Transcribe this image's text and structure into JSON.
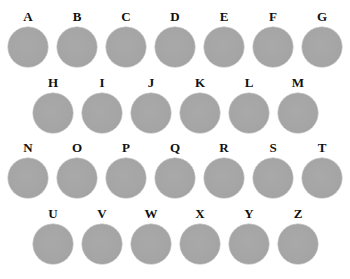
{
  "grid": {
    "disc_color": "#a4a4a4",
    "label_color": "#111111",
    "rows": [
      {
        "labels": [
          "A",
          "B",
          "C",
          "D",
          "E",
          "F",
          "G"
        ]
      },
      {
        "labels": [
          "H",
          "I",
          "J",
          "K",
          "L",
          "M"
        ]
      },
      {
        "labels": [
          "N",
          "O",
          "P",
          "Q",
          "R",
          "S",
          "T"
        ]
      },
      {
        "labels": [
          "U",
          "V",
          "W",
          "X",
          "Y",
          "Z"
        ]
      }
    ]
  }
}
